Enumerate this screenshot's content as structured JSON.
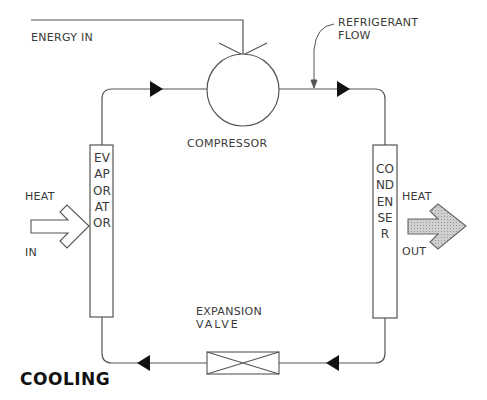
{
  "diagram": {
    "title": "COOLING",
    "labels": {
      "energy_in": "ENERGY IN",
      "refrigerant_flow_line1": "REFRIGERANT",
      "refrigerant_flow_line2": "FLOW",
      "compressor": "COMPRESSOR",
      "evaporator": "EVAPORATOR",
      "condenser": "CONDENSER",
      "heat_in_top": "HEAT",
      "heat_in_bottom": "IN",
      "heat_out_top": "HEAT",
      "heat_out_bottom": "OUT",
      "expansion_valve_line1": "EXPANSION",
      "expansion_valve_line2": "VALVE"
    },
    "components": [
      "compressor",
      "condenser",
      "expansion valve",
      "evaporator"
    ],
    "flow_direction": "clockwise",
    "colors": {
      "line": "#555555",
      "text": "#3a3a3a",
      "heat_out_fill": "#c8c8c8",
      "background": "#ffffff"
    }
  }
}
